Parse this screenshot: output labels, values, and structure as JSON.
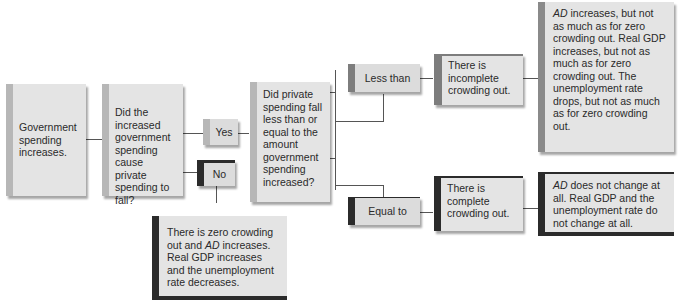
{
  "diagram": {
    "start": "Government spending increases.",
    "question1": "Did the increased government spending cause private spending to fall?",
    "yes_label": "Yes",
    "no_label": "No",
    "question2": "Did private spending fall less than or equal to the amount government spending increased?",
    "less_than_label": "Less than",
    "equal_to_label": "Equal to",
    "incomplete": "There is incomplete crowding out.",
    "complete": "There is complete crowding out.",
    "incomplete_result": {
      "ad": "AD",
      "text": " increases, but not as much as for zero crowding out. Real GDP increases, but not as much as for zero crowding out. The unemployment rate drops, but not as much as for zero crowding out."
    },
    "complete_result": {
      "ad": "AD",
      "text": " does not change at all. Real GDP and the unemployment rate do not change at all."
    },
    "zero_result": {
      "pre": "There is zero crowding out and ",
      "ad": "AD",
      "post": " increases. Real GDP increases and the unemployment rate decreases."
    }
  }
}
